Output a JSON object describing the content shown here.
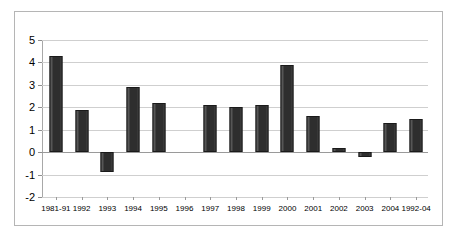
{
  "chart_data": {
    "type": "bar",
    "title": "",
    "subtitle": "",
    "xlabel": "",
    "ylabel": "",
    "grid": true,
    "legend": false,
    "ylim": [
      -2,
      5
    ],
    "yticks": [
      5,
      4,
      3,
      2,
      1,
      0,
      -1,
      -2
    ],
    "ytick_labels": [
      "5",
      "4",
      "3",
      "2",
      "1",
      "0",
      "-1",
      "-2"
    ],
    "categories": [
      "1981-91",
      "1992",
      "1993",
      "1994",
      "1995",
      "1996",
      "1997",
      "1998",
      "1999",
      "2000",
      "2001",
      "2002",
      "2003",
      "2004",
      "1992-04"
    ],
    "values": [
      4.3,
      1.9,
      -0.9,
      2.9,
      2.2,
      0,
      2.1,
      2.0,
      2.1,
      3.9,
      1.6,
      0.2,
      -0.2,
      1.3,
      1.5
    ],
    "series": [
      {
        "name": "",
        "values": [
          4.3,
          1.9,
          -0.9,
          2.9,
          2.2,
          0,
          2.1,
          2.0,
          2.1,
          3.9,
          1.6,
          0.2,
          -0.2,
          1.3,
          1.5
        ]
      }
    ],
    "bar_color": "#2e2e2e",
    "gridline_color": "#cfcfcf",
    "axis_color": "#9a9a9a",
    "border_color": "#b5b5b5",
    "background_color": "#ffffff"
  }
}
